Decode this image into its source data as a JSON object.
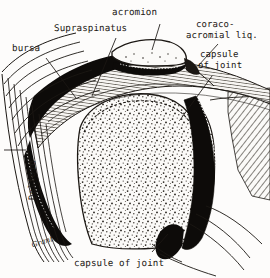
{
  "figure": {
    "kind": "anatomical-illustration",
    "background_color": "#fdfcfb",
    "ink_color": "#1b1713"
  },
  "labels": {
    "acromion": "acromion",
    "supraspinatus": "Supraspinatus",
    "bursa": "bursa",
    "coraco_acromial_lig_line1": "coraco-",
    "coraco_acromial_lig_line2": "acromial liq.",
    "capsule_of_joint_line1": "capsule",
    "capsule_of_joint_line2": "of joint",
    "deltoid": "Deltoid",
    "caption": "capsule of joint",
    "signature": "Grant."
  },
  "structures": [
    {
      "name": "acromion",
      "description": "bone process forming roof of joint, top center"
    },
    {
      "name": "supraspinatus",
      "description": "hatched muscle band running over humeral head"
    },
    {
      "name": "subacromial-bursa",
      "description": "dark curved cleft between deltoid and supraspinatus"
    },
    {
      "name": "coraco-acromial-ligament",
      "description": "dense band at anterior margin of acromion"
    },
    {
      "name": "joint-capsule",
      "description": "dark outline enclosing the joint cavity"
    },
    {
      "name": "deltoid",
      "description": "striated muscle wrapping the lateral aspect"
    },
    {
      "name": "humeral-head",
      "description": "stippled cancellous bone, large oval center"
    },
    {
      "name": "glenoid-and-scapula",
      "description": "hatched bone at right"
    }
  ]
}
